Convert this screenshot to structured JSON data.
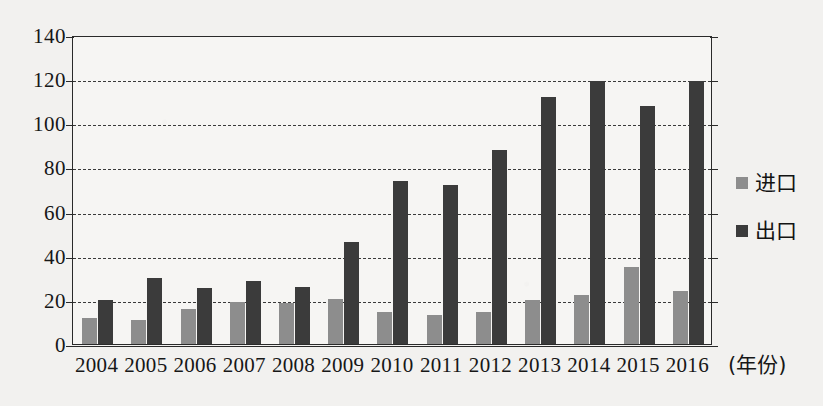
{
  "chart_data": {
    "type": "bar",
    "title": "",
    "xlabel": "(年份)",
    "ylabel": "",
    "categories": [
      "2004",
      "2005",
      "2006",
      "2007",
      "2008",
      "2009",
      "2010",
      "2011",
      "2012",
      "2013",
      "2014",
      "2015",
      "2016"
    ],
    "series": [
      {
        "name": "进口",
        "color": "#8d8d8d",
        "values": [
          12,
          11,
          16,
          19,
          18.5,
          20.5,
          14.5,
          13,
          14.5,
          20,
          22,
          35,
          24
        ]
      },
      {
        "name": "出口",
        "color": "#3b3b3b",
        "values": [
          20,
          30,
          25.5,
          28.5,
          26,
          46,
          74,
          72,
          88,
          112,
          119,
          108,
          119
        ]
      }
    ],
    "ylim": [
      0,
      140
    ],
    "yticks": [
      0,
      20,
      40,
      60,
      80,
      100,
      120,
      140
    ],
    "ytick_labels": [
      "0",
      "20",
      "40",
      "60",
      "80",
      "100",
      "120",
      "140"
    ],
    "grid": true,
    "legend_position": "right"
  },
  "legend": {
    "items": [
      {
        "label": "进口",
        "icon": "square-swatch-light"
      },
      {
        "label": "出口",
        "icon": "square-swatch-dark"
      }
    ]
  },
  "axis": {
    "x_title": "(年份)"
  }
}
